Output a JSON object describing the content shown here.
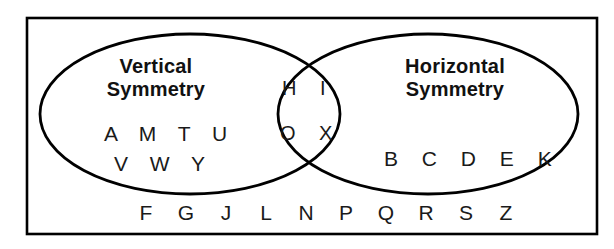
{
  "figure": {
    "type": "venn-diagram",
    "universe_border_color": "#000000",
    "ellipse_stroke_color": "#000000",
    "background_color": "#ffffff",
    "text_color": "#111111"
  },
  "left_set": {
    "title_line1": "Vertical",
    "title_line2": "Symmetry",
    "letters_row1": "A M T U",
    "letters_row2": "V W Y",
    "members": [
      "A",
      "M",
      "T",
      "U",
      "V",
      "W",
      "Y"
    ]
  },
  "right_set": {
    "title_line1": "Horizontal",
    "title_line2": "Symmetry",
    "letters_row1": "B C D E K",
    "members": [
      "B",
      "C",
      "D",
      "E",
      "K"
    ]
  },
  "intersection": {
    "letters_row1": "H I",
    "letters_row2": "O X",
    "members": [
      "H",
      "I",
      "O",
      "X"
    ]
  },
  "outside": {
    "letters": [
      "F",
      "G",
      "J",
      "L",
      "N",
      "P",
      "Q",
      "R",
      "S",
      "Z"
    ]
  }
}
